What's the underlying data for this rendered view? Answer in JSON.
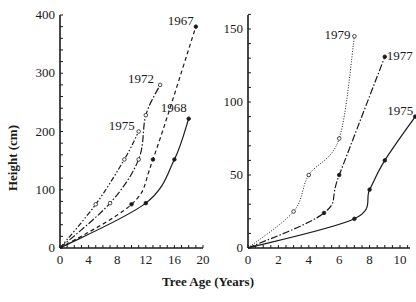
{
  "chart_data": [
    {
      "type": "line",
      "panel": "left",
      "title": "",
      "xlabel": "Tree Age (Years)",
      "ylabel": "Height (cm)",
      "xlim": [
        0,
        20
      ],
      "ylim": [
        0,
        400
      ],
      "xticks": [
        0,
        4,
        8,
        12,
        16,
        20
      ],
      "yticks": [
        0,
        100,
        200,
        300,
        400
      ],
      "grid": false,
      "legend": "inline labels at line ends",
      "series": [
        {
          "name": "1967",
          "style": "dashed",
          "marker": "filled",
          "x": [
            0,
            10,
            13,
            19
          ],
          "y": [
            0,
            75,
            152,
            380
          ]
        },
        {
          "name": "1968",
          "style": "solid",
          "marker": "filled",
          "x": [
            0,
            12,
            16,
            18
          ],
          "y": [
            0,
            77,
            152,
            222
          ]
        },
        {
          "name": "1972",
          "style": "dash-dot",
          "marker": "open",
          "x": [
            0,
            7,
            11,
            12,
            14
          ],
          "y": [
            0,
            77,
            152,
            228,
            280
          ]
        },
        {
          "name": "1975",
          "style": "long-dash-dot",
          "marker": "open",
          "x": [
            0,
            5,
            9,
            11
          ],
          "y": [
            0,
            75,
            152,
            200
          ]
        }
      ]
    },
    {
      "type": "line",
      "panel": "right",
      "title": "",
      "xlabel": "Tree Age (Years)",
      "ylabel": "",
      "xlim": [
        0,
        11
      ],
      "ylim": [
        0,
        150
      ],
      "xticks": [
        0,
        2,
        4,
        6,
        8,
        10
      ],
      "yticks": [
        0,
        50,
        100,
        150
      ],
      "grid": false,
      "legend": "inline labels at line ends",
      "series": [
        {
          "name": "1979",
          "style": "dotted",
          "marker": "open",
          "x": [
            0,
            3,
            4,
            6,
            7
          ],
          "y": [
            0,
            25,
            50,
            75,
            145
          ]
        },
        {
          "name": "1977",
          "style": "dash-dot",
          "marker": "filled",
          "x": [
            0,
            5,
            6,
            9
          ],
          "y": [
            0,
            24,
            50,
            131
          ]
        },
        {
          "name": "1975",
          "style": "solid",
          "marker": "filled",
          "x": [
            0,
            7,
            8,
            9,
            11
          ],
          "y": [
            0,
            20,
            40,
            60,
            90
          ]
        }
      ]
    }
  ],
  "labels": {
    "xlabel": "Tree Age (Years)",
    "ylabel": "Height (cm)"
  }
}
